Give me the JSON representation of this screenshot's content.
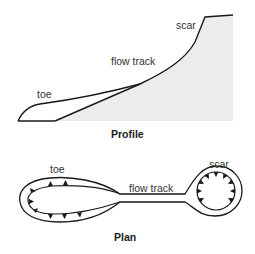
{
  "profile": {
    "title": "Profile",
    "labels": {
      "scar": "scar",
      "flow_track": "flow track",
      "toe": "toe"
    },
    "ground_fill": "#ececec",
    "line_color": "#1a1a1a"
  },
  "plan": {
    "title": "Plan",
    "labels": {
      "toe": "toe",
      "flow_track": "flow track",
      "scar": "scar"
    },
    "line_color": "#1a1a1a"
  }
}
